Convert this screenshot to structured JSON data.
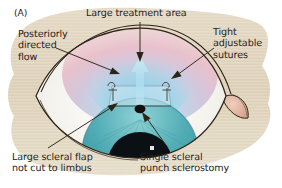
{
  "figure": {
    "panel_label": "(A)",
    "type": "medical-illustration",
    "background_color": "#ffffff",
    "blob_color": "#ded2bb",
    "text_color": "#2b2118"
  },
  "labels": {
    "treatment_area": "Large treatment area",
    "posterior_flow_line1": "Posteriorly",
    "posterior_flow_line2": "directed",
    "posterior_flow_line3": "flow",
    "sutures_line1": "Tight",
    "sutures_line2": "adjustable",
    "sutures_line3": "sutures",
    "scleral_flap_line1": "Large scleral flap",
    "scleral_flap_line2": "not cut to limbus",
    "sclerostomy_line1": "Single scleral",
    "sclerostomy_line2": "punch sclerostomy"
  },
  "colors": {
    "bleb_pink": "#e8b9c4",
    "bleb_blue": "#7fc4e0",
    "iris_teal": "#4aa8b0",
    "pupil_dark": "#0b1014",
    "sclera_white": "#f2f0ea",
    "caruncle_pink": "#dda793",
    "outline": "#2d2418",
    "flow_arrow": "#a8dcee"
  }
}
